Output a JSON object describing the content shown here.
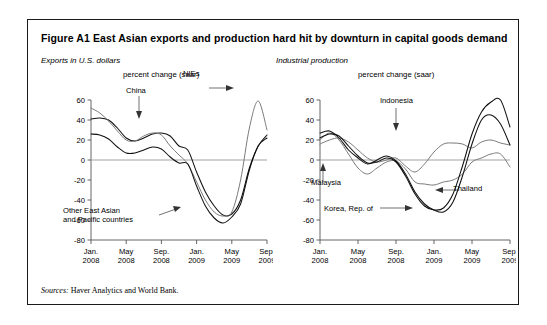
{
  "figure": {
    "number": "Figure A1",
    "title": "East Asian exports and production hard hit by downturn in capital goods demand",
    "full_title": "Figure A1  East Asian exports and production hard hit by downturn in capital goods demand",
    "sources_lead": "Sources:",
    "sources_text": " Haver Analytics and World Bank."
  },
  "panels": {
    "left": {
      "caption": "Exports in U.S. dollars",
      "units": "percent change (saar)",
      "annotations": [
        {
          "name": "china",
          "text": "China"
        },
        {
          "name": "nies",
          "text": "NIEs"
        },
        {
          "name": "other-east-asian",
          "line1": "Other East Asian",
          "line2": "and Pacific countries"
        }
      ]
    },
    "right": {
      "caption": "Industrial production",
      "units": "percent change (saar)",
      "annotations": [
        {
          "name": "indonesia",
          "text": "Indonesia"
        },
        {
          "name": "malaysia",
          "text": "Malaysia"
        },
        {
          "name": "korea",
          "text": "Korea, Rep. of"
        },
        {
          "name": "thailand",
          "text": "Thailand"
        }
      ]
    }
  },
  "axes": {
    "y_ticks": [
      "60",
      "40",
      "20",
      "0",
      "-20",
      "-40",
      "-60",
      "-80"
    ],
    "y_values": [
      60,
      40,
      20,
      0,
      -20,
      -40,
      -60,
      -80
    ],
    "ylim": [
      -80,
      60
    ],
    "x_ticks": [
      {
        "month": "Jan.",
        "year": "2008"
      },
      {
        "month": "May",
        "year": "2008"
      },
      {
        "month": "Sep.",
        "year": "2008"
      },
      {
        "month": "Jan.",
        "year": "2009"
      },
      {
        "month": "May",
        "year": "2009"
      },
      {
        "month": "Sep.",
        "year": "2009"
      }
    ]
  },
  "colors": {
    "frame": "#1a1a1a",
    "line_dark": "#111111",
    "line_grey": "#7a7a7a",
    "axis": "#555555",
    "zero": "#999999"
  },
  "chart_data": [
    {
      "type": "line",
      "panel": "left",
      "title": "Exports in U.S. dollars",
      "ylabel": "percent change (saar)",
      "xlabel": "",
      "ylim": [
        -80,
        60
      ],
      "xlim": [
        0,
        20
      ],
      "grid": false,
      "legend": "inline-annotations",
      "x": [
        0,
        1,
        2,
        3,
        4,
        5,
        6,
        7,
        8,
        9,
        10,
        11,
        12,
        13,
        14,
        15,
        16,
        17,
        18,
        19,
        20
      ],
      "xtick_positions": [
        0,
        4,
        8,
        12,
        16,
        20
      ],
      "series": [
        {
          "name": "China",
          "values": [
            41,
            42,
            40,
            32,
            22,
            19,
            22,
            26,
            27,
            24,
            14,
            10,
            -12,
            -32,
            -46,
            -55,
            -54,
            -40,
            -8,
            14,
            25
          ]
        },
        {
          "name": "NIEs",
          "values": [
            52,
            47,
            39,
            29,
            20,
            19,
            24,
            27,
            25,
            14,
            5,
            -4,
            -22,
            -40,
            -52,
            -56,
            -52,
            -20,
            32,
            59,
            30
          ]
        },
        {
          "name": "Other East Asian and Pacific countries",
          "values": [
            26,
            25,
            21,
            13,
            7,
            7,
            10,
            13,
            11,
            3,
            -3,
            -4,
            -26,
            -46,
            -58,
            -63,
            -57,
            -44,
            -10,
            14,
            22
          ]
        }
      ]
    },
    {
      "type": "line",
      "panel": "right",
      "title": "Industrial production",
      "ylabel": "percent change (saar)",
      "xlabel": "",
      "ylim": [
        -80,
        60
      ],
      "xlim": [
        0,
        20
      ],
      "grid": false,
      "legend": "inline-annotations",
      "x": [
        0,
        1,
        2,
        3,
        4,
        5,
        6,
        7,
        8,
        9,
        10,
        11,
        12,
        13,
        14,
        15,
        16,
        17,
        18,
        19,
        20
      ],
      "xtick_positions": [
        0,
        4,
        8,
        12,
        16,
        20
      ],
      "series": [
        {
          "name": "Indonesia",
          "values": [
            16,
            20,
            22,
            18,
            10,
            2,
            -2,
            0,
            2,
            -6,
            -12,
            -4,
            8,
            16,
            17,
            16,
            12,
            18,
            20,
            17,
            15
          ]
        },
        {
          "name": "Malaysia",
          "values": [
            20,
            27,
            20,
            6,
            -8,
            -14,
            -8,
            -2,
            -1,
            -9,
            -22,
            -24,
            -25,
            -22,
            -20,
            -14,
            -2,
            2,
            6,
            6,
            -7
          ]
        },
        {
          "name": "Korea, Rep. of",
          "values": [
            27,
            29,
            22,
            10,
            2,
            -4,
            0,
            4,
            -1,
            -14,
            -32,
            -44,
            -50,
            -52,
            -42,
            -16,
            16,
            40,
            45,
            36,
            15
          ]
        },
        {
          "name": "Thailand",
          "values": [
            22,
            26,
            24,
            14,
            4,
            -3,
            -2,
            2,
            -2,
            -16,
            -34,
            -46,
            -50,
            -48,
            -34,
            -6,
            26,
            48,
            58,
            60,
            33
          ]
        }
      ]
    }
  ]
}
